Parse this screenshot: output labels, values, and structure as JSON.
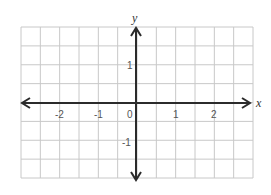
{
  "chart_data": {
    "type": "coordinate-plane",
    "title": "",
    "xlabel": "x",
    "ylabel": "y",
    "xlim": [
      -3,
      3
    ],
    "ylim": [
      -2,
      2
    ],
    "grid": true,
    "grid_step": 0.5,
    "x_ticks": [
      {
        "value": -2,
        "label": "-2"
      },
      {
        "value": -1,
        "label": "-1"
      },
      {
        "value": 0,
        "label": "0"
      },
      {
        "value": 1,
        "label": "1"
      },
      {
        "value": 2,
        "label": "2"
      }
    ],
    "y_ticks": [
      {
        "value": 1,
        "label": "1"
      },
      {
        "value": -1,
        "label": "-1"
      }
    ],
    "arrows": {
      "x_axis": "both",
      "y_axis": "both"
    }
  },
  "colors": {
    "grid": "#c8c8c8",
    "axis": "#2b2b2b",
    "tick_text": "#555555",
    "background": "#ffffff"
  },
  "labels": {
    "x_axis": "x",
    "y_axis": "y",
    "origin": "0",
    "x_neg2": "-2",
    "x_neg1": "-1",
    "x_pos1": "1",
    "x_pos2": "2",
    "y_pos1": "1",
    "y_neg1": "-1"
  }
}
